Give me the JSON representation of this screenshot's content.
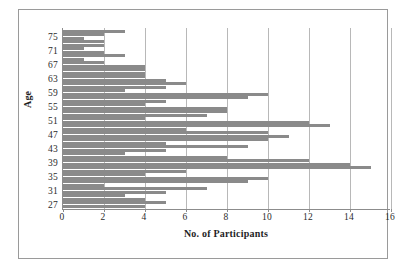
{
  "chart_data": {
    "type": "bar",
    "orientation": "horizontal",
    "title": "",
    "xlabel": "No. of Participants",
    "ylabel": "Age",
    "xlim": [
      0,
      16
    ],
    "ylim": [
      26,
      78
    ],
    "xticks": [
      0,
      2,
      4,
      6,
      8,
      10,
      12,
      14,
      16
    ],
    "yticks": [
      27,
      31,
      35,
      39,
      43,
      47,
      51,
      55,
      59,
      63,
      67,
      71,
      75
    ],
    "grid": "vertical",
    "legend": "none",
    "bar_color": "#8a8a8a",
    "categories": [
      27,
      28,
      29,
      30,
      31,
      32,
      33,
      34,
      35,
      36,
      37,
      38,
      39,
      40,
      41,
      42,
      43,
      44,
      45,
      46,
      47,
      48,
      49,
      50,
      51,
      52,
      53,
      54,
      55,
      56,
      57,
      58,
      59,
      60,
      61,
      62,
      63,
      64,
      65,
      66,
      67,
      68,
      69,
      70,
      71,
      72,
      73,
      74,
      75,
      76,
      77
    ],
    "values": [
      4,
      5,
      4,
      3,
      5,
      7,
      2,
      9,
      10,
      4,
      6,
      15,
      14,
      12,
      8,
      3,
      5,
      9,
      5,
      10,
      11,
      10,
      6,
      13,
      12,
      4,
      7,
      8,
      8,
      4,
      5,
      9,
      10,
      3,
      5,
      6,
      5,
      4,
      4,
      4,
      4,
      2,
      1,
      3,
      2,
      1,
      2,
      2,
      1,
      2,
      3
    ]
  },
  "axis": {
    "x_title": "No. of Participants",
    "y_title": "Age",
    "x_tick_labels": [
      "0",
      "2",
      "4",
      "6",
      "8",
      "10",
      "12",
      "14",
      "16"
    ],
    "y_tick_labels": [
      "75",
      "71",
      "67",
      "63",
      "59",
      "55",
      "51",
      "47",
      "43",
      "39",
      "35",
      "31",
      "27"
    ]
  },
  "colors": {
    "bar": "#8a8a8a",
    "gridline": "#b8b8b8",
    "axis": "#8c8c8c",
    "frame": "#9a9a9a",
    "text": "#2b2b2b"
  }
}
